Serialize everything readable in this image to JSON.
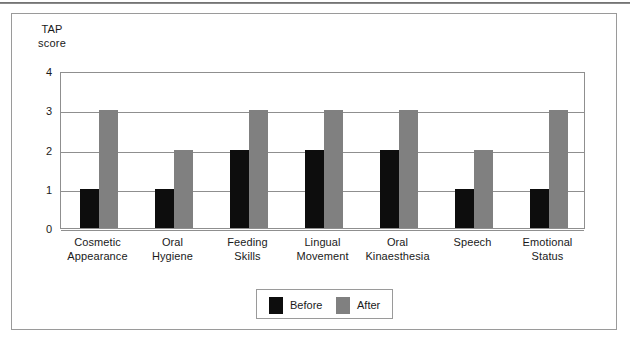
{
  "figure": {
    "axis_title_line1": "TAP",
    "axis_title_line2": "score"
  },
  "legend": {
    "position": "bottom-center",
    "entries": [
      {
        "label": "Before",
        "color": "#0d0d0d"
      },
      {
        "label": "After",
        "color": "#808080"
      }
    ]
  },
  "colors": {
    "before": "#0d0d0d",
    "after": "#808080",
    "frame": "#9a9a9a",
    "gridline": "#8f8f8f",
    "background": "#ffffff"
  },
  "chart_data": {
    "type": "bar",
    "title": "",
    "subtitle": "",
    "xlabel": "",
    "ylabel": "TAP score",
    "ylim": [
      0,
      4
    ],
    "yticks": [
      0,
      1,
      2,
      3,
      4
    ],
    "ytick_labels": [
      "0",
      "1",
      "2",
      "3",
      "4"
    ],
    "grid": true,
    "grid_axis": "y",
    "legend_position": "bottom-center",
    "categories": [
      "Cosmetic Appearance",
      "Oral Hygiene",
      "Feeding Skills",
      "Lingual Movement",
      "Oral Kinaesthesia",
      "Speech",
      "Emotional Status"
    ],
    "category_lines": [
      [
        "Cosmetic",
        "Appearance"
      ],
      [
        "Oral",
        "Hygiene"
      ],
      [
        "Feeding",
        "Skills"
      ],
      [
        "Lingual",
        "Movement"
      ],
      [
        "Oral",
        "Kinaesthesia"
      ],
      [
        "Speech",
        ""
      ],
      [
        "Emotional",
        "Status"
      ]
    ],
    "series": [
      {
        "name": "Before",
        "color": "#0d0d0d",
        "values": [
          1,
          1,
          2,
          2,
          2,
          1,
          1
        ]
      },
      {
        "name": "After",
        "color": "#808080",
        "values": [
          3,
          2,
          3,
          3,
          3,
          2,
          3
        ]
      }
    ]
  }
}
